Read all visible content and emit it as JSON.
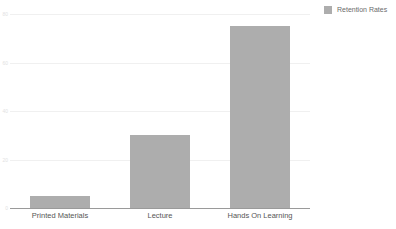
{
  "chart_data": {
    "type": "bar",
    "title": "",
    "xlabel": "",
    "ylabel": "",
    "categories": [
      "Printed Materials",
      "Lecture",
      "Hands On Learning"
    ],
    "series": [
      {
        "name": "Retention Rates",
        "values": [
          5,
          30,
          75
        ],
        "color": "#adadad"
      }
    ],
    "ylim": [
      0,
      80
    ],
    "yticks": [
      0,
      20,
      40,
      60,
      80
    ],
    "ytick_labels": [
      "0",
      "20",
      "40",
      "60",
      "80"
    ],
    "grid": true,
    "legend_position": "top-right"
  },
  "legend": {
    "entries": [
      {
        "label": "Retention Rates",
        "color": "#adadad"
      }
    ]
  },
  "colors": {
    "bar": "#adadad",
    "gridline": "#f0f0f0",
    "axis": "#9a9a9a",
    "xtick_text": "#565656",
    "ytick_text": "#e2e2e2",
    "legend_text": "#6b6b6b",
    "background": "#ffffff"
  }
}
